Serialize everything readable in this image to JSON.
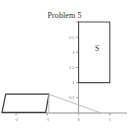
{
  "figure": {
    "title": "Problem 5",
    "width": 129,
    "height": 133,
    "background": "#ffffff"
  },
  "chart_data": {
    "type": "diagram",
    "title": "Problem 5",
    "xlabel": "",
    "ylabel": "",
    "xlim": [
      -2.45,
      1.55
    ],
    "ylim": [
      -0.35,
      3.2
    ],
    "grid": false,
    "legend": null,
    "axis_color": "#8c8c8c",
    "x_ticks": [
      {
        "value": -2,
        "label": "-2"
      },
      {
        "value": -1,
        "label": "-1"
      },
      {
        "value": 0,
        "label": "0"
      },
      {
        "value": 1,
        "label": "1"
      }
    ],
    "y_ticks": [
      {
        "value": 0.5,
        "label": "0.5"
      },
      {
        "value": 1,
        "label": "1"
      },
      {
        "value": 1.5,
        "label": "1.5"
      },
      {
        "value": 2,
        "label": "2"
      },
      {
        "value": 2.5,
        "label": "2.5"
      },
      {
        "value": 3,
        "label": "3"
      }
    ],
    "shapes": [
      {
        "name": "region-S-square",
        "kind": "polygon",
        "label": "S",
        "label_point": [
          0.62,
          2.1
        ],
        "points": [
          [
            0,
            1
          ],
          [
            1,
            1
          ],
          [
            1,
            3
          ],
          [
            0,
            3
          ]
        ],
        "stroke": "#4a4a4a",
        "stroke_width": 1.1,
        "fill": "none"
      },
      {
        "name": "parallelogram-dark",
        "kind": "polygon",
        "points": [
          [
            -2.33,
            0.62
          ],
          [
            -0.95,
            0.62
          ],
          [
            -1.05,
            0.02
          ],
          [
            -2.45,
            0.02
          ]
        ],
        "stroke": "#3a3a3a",
        "stroke_width": 1.2,
        "fill": "none"
      },
      {
        "name": "triangle-light",
        "kind": "polygon",
        "points": [
          [
            -0.95,
            0.62
          ],
          [
            0.72,
            0.0
          ],
          [
            -0.95,
            0.0
          ]
        ],
        "stroke": "#bdbdbd",
        "stroke_width": 1.0,
        "fill": "none"
      }
    ],
    "series": []
  },
  "labels": {
    "region_S": "S"
  }
}
